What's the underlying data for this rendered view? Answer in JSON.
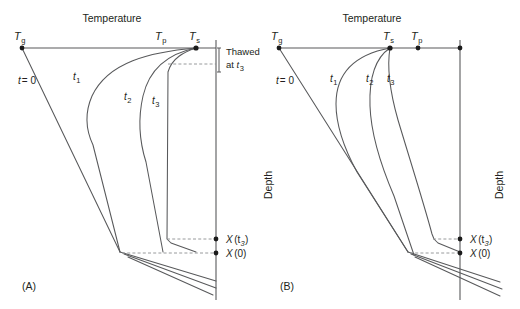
{
  "figure": {
    "type": "scientific-diagram",
    "panels": [
      {
        "id": "A",
        "panel_label": "(A)",
        "axis_titles": {
          "top": "Temperature",
          "side": ""
        },
        "temperature_marks": [
          {
            "symbol": "T",
            "subscript": "g",
            "x": 22
          },
          {
            "symbol": "T",
            "subscript": "p",
            "x": 163
          },
          {
            "symbol": "T",
            "subscript": "s",
            "x": 196
          }
        ],
        "curves": [
          {
            "label": "t",
            "sub": "= 0",
            "kind": "initial"
          },
          {
            "label": "t",
            "sub": "1",
            "kind": "time"
          },
          {
            "label": "t",
            "sub": "2",
            "kind": "time"
          },
          {
            "label": "t",
            "sub": "3",
            "kind": "time"
          }
        ],
        "annotation": {
          "line1": "Thawed",
          "line2_prefix": "at ",
          "line2_symbol": "t",
          "line2_sub": "3"
        },
        "depth_marks": [
          {
            "symbol": "X",
            "arg": "(t",
            "sub": "3",
            "close": ")",
            "y": 239
          },
          {
            "symbol": "X",
            "arg": "(0)",
            "sub": "",
            "close": "",
            "y": 253
          }
        ]
      },
      {
        "id": "B",
        "panel_label": "(B)",
        "axis_titles": {
          "top": "Temperature",
          "side": "Depth"
        },
        "temperature_marks": [
          {
            "symbol": "T",
            "subscript": "g",
            "x": 279
          },
          {
            "symbol": "T",
            "subscript": "s",
            "x": 390
          },
          {
            "symbol": "T",
            "subscript": "p",
            "x": 418
          }
        ],
        "curves": [
          {
            "label": "t",
            "sub": "= 0",
            "kind": "initial"
          },
          {
            "label": "t",
            "sub": "1",
            "kind": "time"
          },
          {
            "label": "t",
            "sub": "2",
            "kind": "time"
          },
          {
            "label": "t",
            "sub": "3",
            "kind": "time"
          }
        ],
        "depth_marks": [
          {
            "symbol": "X",
            "arg": "(t",
            "sub": "3",
            "close": ")",
            "y": 239
          },
          {
            "symbol": "X",
            "arg": "(0)",
            "sub": "",
            "close": "",
            "y": 253
          }
        ]
      }
    ],
    "depth_axis_label": "Depth",
    "colors": {
      "line": "#58595b",
      "dashed": "#8d8f91",
      "text": "#231f20",
      "dot": "#1b1b1b",
      "background": "#ffffff"
    }
  },
  "labels": {
    "temperature": "Temperature",
    "depth": "Depth",
    "panel_a": "(A)",
    "panel_b": "(B)",
    "t_equals_zero": "t",
    "t_equals_zero_rest": "= 0",
    "thawed": "Thawed",
    "at": "at ",
    "T": "T",
    "X": "X",
    "sub_g": "g",
    "sub_p": "p",
    "sub_s": "s",
    "sub_1": "1",
    "sub_2": "2",
    "sub_3": "3",
    "x_t3_open": "(t",
    "x_t3_close": ")",
    "x_zero": "(0)",
    "t": "t"
  }
}
